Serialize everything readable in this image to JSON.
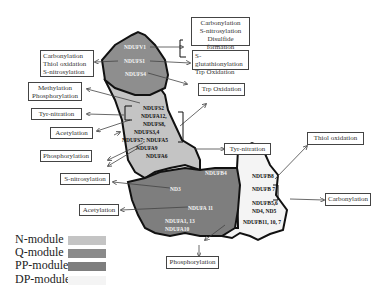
{
  "diagram": {
    "colors": {
      "n_module": "#c4c4c4",
      "q_module": "#8a8a8a",
      "pp_module": "#7e7e7e",
      "dp_module": "#f4f4f4",
      "outline": "#111111"
    },
    "n_module_subunits": [
      "NDUFV1",
      "NDUFS1",
      "NDUFS4"
    ],
    "q_module_subunits": [
      "NDUFS2",
      "NDUFA12,",
      "NDUFS8,",
      "NDUFS3,4",
      "NDUFS7; NDUFA5",
      "NDUFA9",
      "NDUFA6"
    ],
    "pp_module_subunits": [
      "NDUFB4",
      "ND3",
      "NDUFA 11",
      "NDUFA1, 13",
      "NDUFA10"
    ],
    "dp_module_subunits": [
      "NDUFB8",
      "NDUFB 7",
      "NDUFB5,6",
      "ND4, ND5",
      "NDUFB11, 10, 7"
    ],
    "modifications": {
      "carbonylation_snitro_disulfide": [
        "Carbonylation",
        "S-nitrosylation",
        "Disulfide formation"
      ],
      "sglut_trp": [
        "S-glutathionylation",
        "Trp Oxidation"
      ],
      "trp_oxidation": "Trp Oxidation",
      "carb_thiol_snitro": [
        "Carbonylation",
        "Thiol oxidation",
        "S-nitrosylation"
      ],
      "methyl_phospho": [
        "Methylation",
        "Phosphorylation"
      ],
      "tyr_nitration_left": "Tyr-nitration",
      "acetylation_top": "Acetylation",
      "phosphorylation_left": "Phosphorylation",
      "s_nitrosylation": "S-nitrosylation",
      "acetylation_bottom": "Acetylation",
      "tyr_nitration_right": "Tyr-nitration",
      "thiol_oxidation": "Thiol oxidation",
      "carbonylation_right": "Carbonylation",
      "phosphorylation_bottom": "Phosphorylation"
    },
    "legend": [
      {
        "label": "N-module"
      },
      {
        "label": "Q-module"
      },
      {
        "label": "PP-module"
      },
      {
        "label": "DP-module :"
      }
    ]
  }
}
